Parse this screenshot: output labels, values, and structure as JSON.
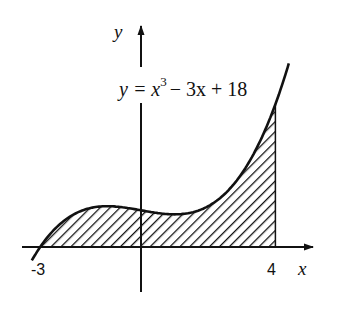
{
  "chart_data": {
    "type": "area",
    "title": "",
    "function": "y = x^3 - 3x + 18",
    "coefficients": {
      "a3": 1,
      "a2": 0,
      "a1": -3,
      "a0": 18
    },
    "shaded_interval": [
      -3,
      4
    ],
    "xlabel": "x",
    "ylabel": "y",
    "x_tick_labels": [
      {
        "x": -3,
        "label": "-3"
      },
      {
        "x": 4,
        "label": "4"
      }
    ],
    "xlim": [
      -3.5,
      5.2
    ],
    "ylim": [
      -22,
      108
    ],
    "grid": false,
    "legend": null,
    "fill": "diagonal-hatch"
  },
  "labels": {
    "equation_lhs": "y = x",
    "equation_exp": "3",
    "equation_rhs": "− 3x + 18",
    "x_axis": "x",
    "y_axis": "y",
    "tick_neg3": "-3",
    "tick_4": "4"
  },
  "colors": {
    "ink": "#111111",
    "background": "#ffffff"
  }
}
